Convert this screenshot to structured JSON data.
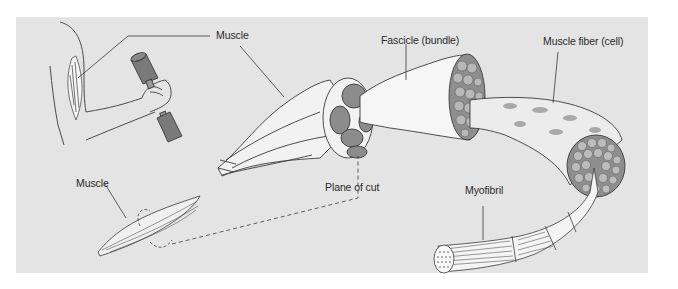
{
  "diagram": {
    "type": "anatomy-hierarchy",
    "colors": {
      "background_panel": "#e4e4e4",
      "outline": "#3a3a3a",
      "tissue_fill": "#f4f4f4",
      "bundle_fill": "#8c8c8c",
      "dumbbell_fill": "#7a7a7a",
      "label_text": "#2a2a2a"
    },
    "labels": {
      "muscle_top": "Muscle",
      "fascicle": "Fascicle (bundle)",
      "muscle_fiber": "Muscle fiber (cell)",
      "muscle_bottom": "Muscle",
      "plane_of_cut": "Plane of cut",
      "myofibril": "Myofibril"
    },
    "hierarchy": [
      "Muscle",
      "Fascicle (bundle)",
      "Muscle fiber (cell)",
      "Myofibril"
    ]
  }
}
